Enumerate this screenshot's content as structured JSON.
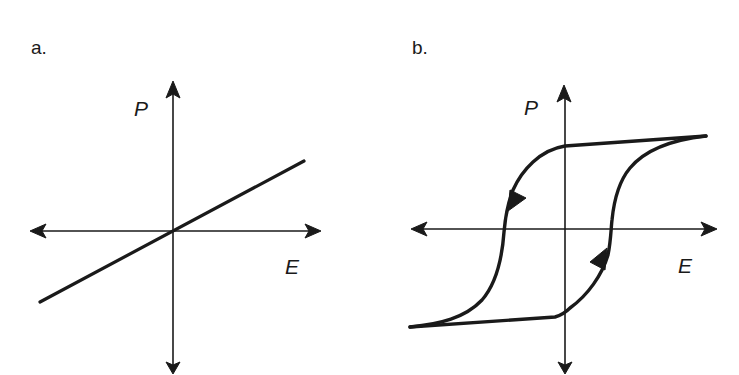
{
  "panels": [
    {
      "label": "a.",
      "y_axis_label": "P",
      "x_axis_label": "E",
      "description": "linear P-E relation through origin"
    },
    {
      "label": "b.",
      "y_axis_label": "P",
      "x_axis_label": "E",
      "description": "ferroelectric hysteresis loop with direction arrows"
    }
  ],
  "colors": {
    "ink": "#1a1a1a",
    "background": "#ffffff"
  }
}
